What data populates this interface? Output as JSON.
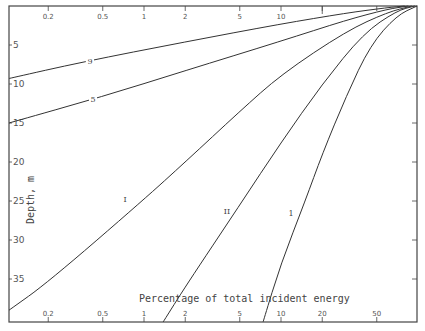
{
  "chart_data": {
    "type": "line",
    "title": "",
    "xlabel": "Percentage of total incident energy",
    "ylabel": "Depth, m",
    "xscale": "log",
    "xlim": [
      0.1,
      100
    ],
    "ylim": [
      0,
      40.5
    ],
    "y_inverted": true,
    "grid": false,
    "legend": "none (curves labelled inline)",
    "x_ticks": [
      0.2,
      0.5,
      1,
      2,
      5,
      10,
      20,
      50
    ],
    "x_tick_labels_top": [
      "0.2",
      "0.5",
      "1",
      "2",
      "5",
      "10"
    ],
    "x_tick_labels_bottom": [
      "0.2",
      "0.5",
      "1",
      "2",
      "5",
      "10",
      "20",
      "50"
    ],
    "y_ticks": [
      5,
      10,
      15,
      20,
      25,
      30,
      35
    ],
    "y_tick_labels": [
      "5",
      "10",
      "15",
      "20",
      "25",
      "30",
      "35"
    ],
    "series": [
      {
        "name": "9",
        "label": "9",
        "points": [
          [
            0.1,
            9.3
          ],
          [
            0.35,
            7.2
          ],
          [
            2,
            4.6
          ],
          [
            10,
            2.3
          ],
          [
            30,
            0.9
          ],
          [
            60,
            0.2
          ],
          [
            80,
            0
          ]
        ]
      },
      {
        "name": "5",
        "label": "5",
        "points": [
          [
            0.1,
            15.0
          ],
          [
            0.5,
            11.6
          ],
          [
            2,
            8.3
          ],
          [
            10,
            4.5
          ],
          [
            30,
            1.8
          ],
          [
            60,
            0.4
          ],
          [
            85,
            0
          ]
        ]
      },
      {
        "name": "I",
        "label": "I",
        "points": [
          [
            0.1,
            39.0
          ],
          [
            0.2,
            35.4
          ],
          [
            1,
            24.8
          ],
          [
            2,
            20.0
          ],
          [
            5,
            13.5
          ],
          [
            10,
            8.8
          ],
          [
            30,
            3.2
          ],
          [
            60,
            0.8
          ],
          [
            90,
            0
          ]
        ]
      },
      {
        "name": "II",
        "label": "II",
        "points": [
          [
            1.38,
            40.5
          ],
          [
            2,
            36.0
          ],
          [
            5,
            25.5
          ],
          [
            10,
            17.5
          ],
          [
            20,
            10.0
          ],
          [
            40,
            3.5
          ],
          [
            70,
            0.6
          ],
          [
            95,
            0
          ]
        ]
      },
      {
        "name": "1",
        "label": "1",
        "points": [
          [
            7.4,
            40.5
          ],
          [
            10,
            33.0
          ],
          [
            15,
            25.0
          ],
          [
            20,
            19.0
          ],
          [
            30,
            11.5
          ],
          [
            45,
            5.0
          ],
          [
            70,
            1.2
          ],
          [
            100,
            0
          ]
        ]
      }
    ]
  },
  "axes": {
    "x_title": "Percentage of total incident energy",
    "y_title": "Depth, m"
  }
}
